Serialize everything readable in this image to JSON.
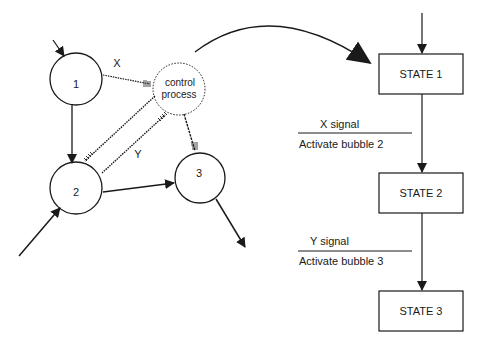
{
  "left_diagram": {
    "bubbles": [
      {
        "id": "bubble-1",
        "label": "1"
      },
      {
        "id": "bubble-2",
        "label": "2"
      },
      {
        "id": "bubble-3",
        "label": "3"
      }
    ],
    "control": {
      "line1": "control",
      "line2": "process"
    },
    "flows": {
      "x_label": "X",
      "y_label": "Y"
    }
  },
  "right_diagram": {
    "states": [
      {
        "label": "STATE 1"
      },
      {
        "label": "STATE 2"
      },
      {
        "label": "STATE 3"
      }
    ],
    "transitions": [
      {
        "condition": "X signal",
        "action": "Activate bubble 2"
      },
      {
        "condition": "Y signal",
        "action": "Activate bubble 3"
      }
    ]
  },
  "colors": {
    "ink": "#1a1a1a",
    "background": "#ffffff"
  }
}
